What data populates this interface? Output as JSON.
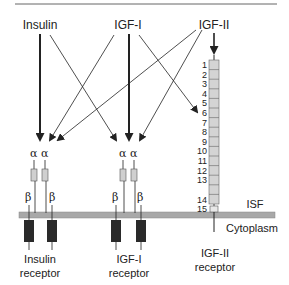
{
  "diagram": {
    "ligands": [
      {
        "label": "Insulin"
      },
      {
        "label": "IGF-I"
      },
      {
        "label": "IGF-II"
      }
    ],
    "receptors": [
      {
        "label_line1": "Insulin",
        "label_line2": "receptor",
        "subunits": {
          "alpha": "α",
          "beta": "β"
        }
      },
      {
        "label_line1": "IGF-I",
        "label_line2": "receptor",
        "subunits": {
          "alpha": "α",
          "beta": "β"
        }
      },
      {
        "label_line1": "IGF-II",
        "label_line2": "receptor",
        "domains": [
          "1",
          "2",
          "3",
          "4",
          "5",
          "6",
          "7",
          "8",
          "9",
          "10",
          "11",
          "12",
          "13",
          "14",
          "15"
        ]
      }
    ],
    "compartments": {
      "outside": "ISF",
      "inside": "Cytoplasm"
    },
    "edges": [
      {
        "from": "Insulin",
        "to": "Insulin receptor",
        "weight": "strong"
      },
      {
        "from": "Insulin",
        "to": "IGF-I receptor",
        "weight": "weak"
      },
      {
        "from": "IGF-I",
        "to": "Insulin receptor",
        "weight": "weak"
      },
      {
        "from": "IGF-I",
        "to": "IGF-I receptor",
        "weight": "strong"
      },
      {
        "from": "IGF-I",
        "to": "IGF-II receptor",
        "weight": "weak"
      },
      {
        "from": "IGF-II",
        "to": "Insulin receptor",
        "weight": "weak"
      },
      {
        "from": "IGF-II",
        "to": "IGF-I receptor",
        "weight": "weak"
      },
      {
        "from": "IGF-II",
        "to": "IGF-II receptor",
        "weight": "strong"
      }
    ],
    "colors": {
      "membrane": "#a8a8a8",
      "alpha_box": "#cfcfcf",
      "domain_box": "#d4d4d4",
      "kinase_box": "#2a2a2a",
      "line": "#222222"
    }
  }
}
